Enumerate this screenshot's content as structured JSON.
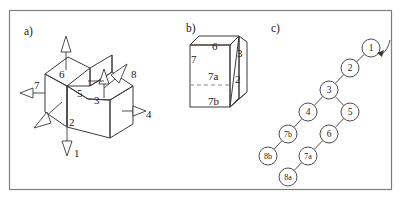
{
  "figure": {
    "background_color": "#ffffff",
    "stroke_color": "#3a3a3a",
    "text_color": "#1a1a1a",
    "frame": {
      "x": 9,
      "y": 10,
      "width": 383,
      "height": 180
    }
  },
  "panels": [
    {
      "id": "a",
      "label": "a)",
      "x": 24,
      "y": 26,
      "caption": "isometric stepped-block solid with eight numbered face arrows"
    },
    {
      "id": "b",
      "label": "b)",
      "x": 186,
      "y": 23,
      "caption": "cube with wedge, face 7 split into 7a and 7b"
    },
    {
      "id": "c",
      "label": "c)",
      "x": 271,
      "y": 23,
      "caption": "face adjacency node graph"
    }
  ],
  "panel_a": {
    "arrow_labels": [
      {
        "name": "arrow-label-1",
        "text": "1",
        "x": 74,
        "y": 148
      },
      {
        "name": "arrow-label-2",
        "text": "2",
        "x": 69,
        "y": 117
      },
      {
        "name": "arrow-label-3",
        "text": "3",
        "x": 94,
        "y": 95
      },
      {
        "name": "arrow-label-4",
        "text": "4",
        "x": 146,
        "y": 109
      },
      {
        "name": "arrow-label-5",
        "text": "5",
        "x": 77,
        "y": 88
      },
      {
        "name": "arrow-label-6",
        "text": "6",
        "x": 59,
        "y": 69
      },
      {
        "name": "arrow-label-7",
        "text": "7",
        "x": 34,
        "y": 80
      },
      {
        "name": "arrow-label-8",
        "text": "8",
        "x": 131,
        "y": 69
      }
    ]
  },
  "panel_b": {
    "face_labels": [
      {
        "name": "face-label-6",
        "text": "6",
        "x": 212,
        "y": 41
      },
      {
        "name": "face-label-7",
        "text": "7",
        "x": 191,
        "y": 54
      },
      {
        "name": "face-label-7a",
        "text": "7a",
        "x": 208,
        "y": 71
      },
      {
        "name": "face-label-7b",
        "text": "7b",
        "x": 208,
        "y": 96
      },
      {
        "name": "face-label-3",
        "text": "3",
        "x": 237,
        "y": 48
      },
      {
        "name": "face-label-2",
        "text": "2",
        "x": 235,
        "y": 74
      }
    ]
  },
  "chart_data": {
    "type": "diagram-graph",
    "nodes": [
      {
        "id": "1",
        "label": "1",
        "cx": 371,
        "cy": 48,
        "r": 9
      },
      {
        "id": "2",
        "label": "2",
        "cx": 350,
        "cy": 68,
        "r": 9
      },
      {
        "id": "3",
        "label": "3",
        "cx": 329,
        "cy": 90,
        "r": 9
      },
      {
        "id": "4",
        "label": "4",
        "cx": 308,
        "cy": 112,
        "r": 9
      },
      {
        "id": "5",
        "label": "5",
        "cx": 350,
        "cy": 112,
        "r": 9
      },
      {
        "id": "6",
        "label": "6",
        "cx": 329,
        "cy": 134,
        "r": 9
      },
      {
        "id": "7b",
        "label": "7b",
        "cx": 288,
        "cy": 134,
        "r": 9
      },
      {
        "id": "7a",
        "label": "7a",
        "cx": 308,
        "cy": 156,
        "r": 9
      },
      {
        "id": "8b",
        "label": "8b",
        "cx": 268,
        "cy": 156,
        "r": 9
      },
      {
        "id": "8a",
        "label": "8a",
        "cx": 288,
        "cy": 177,
        "r": 9
      }
    ],
    "edges": [
      {
        "from": "1",
        "to": "2"
      },
      {
        "from": "2",
        "to": "3"
      },
      {
        "from": "3",
        "to": "4"
      },
      {
        "from": "3",
        "to": "5"
      },
      {
        "from": "4",
        "to": "7b"
      },
      {
        "from": "5",
        "to": "6"
      },
      {
        "from": "6",
        "to": "7a"
      },
      {
        "from": "7b",
        "to": "8b"
      },
      {
        "from": "7a",
        "to": "8a"
      }
    ],
    "entry_arrow": {
      "name": "root-entry-arrow",
      "target": "1",
      "from_x": 390,
      "from_y": 40,
      "to_x": 381,
      "to_y": 54
    }
  }
}
